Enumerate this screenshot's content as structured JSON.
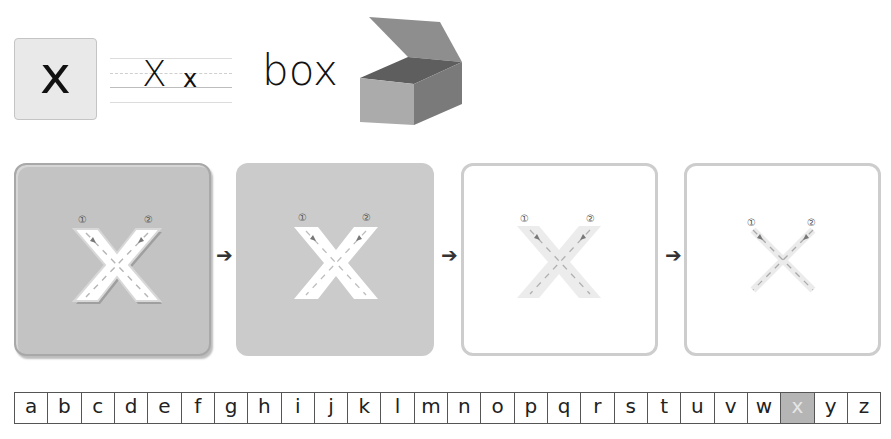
{
  "letter_card": {
    "letter": "x"
  },
  "writing_guide": {
    "uppercase": "X",
    "lowercase": "x"
  },
  "example_word": {
    "word": "box",
    "image": "open-box-illustration"
  },
  "stroke_steps": {
    "stroke_labels": [
      "①",
      "②"
    ],
    "panels": [
      {
        "step": 1,
        "style": "embossed"
      },
      {
        "step": 2,
        "style": "flat"
      },
      {
        "step": 3,
        "style": "faded"
      },
      {
        "step": 4,
        "style": "thin"
      }
    ],
    "arrow_glyph": "➔"
  },
  "alphabet": {
    "letters": [
      "a",
      "b",
      "c",
      "d",
      "e",
      "f",
      "g",
      "h",
      "i",
      "j",
      "k",
      "l",
      "m",
      "n",
      "o",
      "p",
      "q",
      "r",
      "s",
      "t",
      "u",
      "v",
      "w",
      "x",
      "y",
      "z"
    ],
    "active": "x"
  },
  "colors": {
    "active_cell": "#b5b5b5",
    "panel_dark": "#c3c3c3",
    "panel_border": "#cdcdcd"
  }
}
